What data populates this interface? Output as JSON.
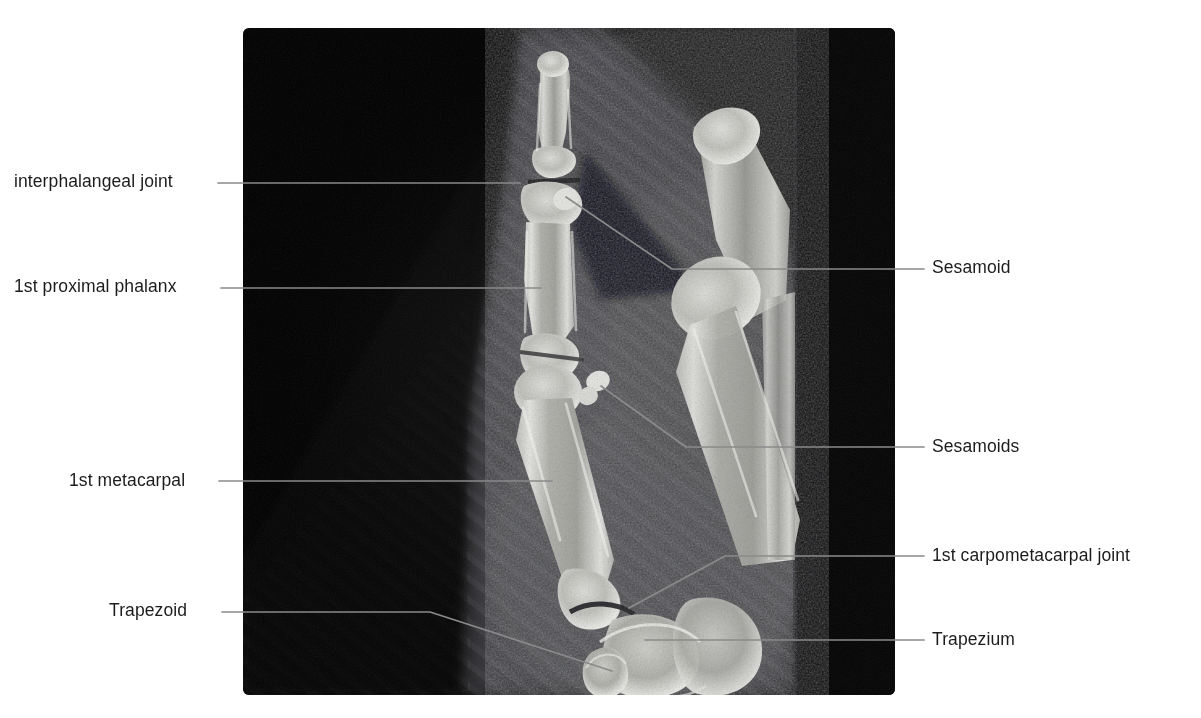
{
  "figure": {
    "type": "annotated-radiograph",
    "background_color": "#ffffff",
    "text_color": "#1c1c1c",
    "leader_color": "#8a8a8a",
    "panel": {
      "x": 243,
      "y": 28,
      "width": 652,
      "height": 667,
      "background_color": "#050505",
      "corner_radius": 6
    }
  },
  "labels": {
    "left": [
      {
        "id": "interphalangeal-joint",
        "text": "interphalangeal joint",
        "text_x": 14,
        "text_y": 172,
        "leader": "M218,183 L520,183"
      },
      {
        "id": "first-proximal-phalanx",
        "text": "1st proximal phalanx",
        "text_x": 14,
        "text_y": 277,
        "leader": "M221,288 L541,288"
      },
      {
        "id": "first-metacarpal",
        "text": "1st metacarpal",
        "text_x": 69,
        "text_y": 471,
        "leader": "M219,481 L552,481"
      },
      {
        "id": "trapezoid",
        "text": "Trapezoid",
        "text_x": 109,
        "text_y": 601,
        "leader": "M222,612 L430,612 L612,671"
      }
    ],
    "right": [
      {
        "id": "sesamoid",
        "text": "Sesamoid",
        "text_x": 932,
        "text_y": 258,
        "leader": "M924,269 L672,269 L566,197"
      },
      {
        "id": "sesamoids",
        "text": "Sesamoids",
        "text_x": 932,
        "text_y": 437,
        "leader": "M924,447 L686,447 L601,386"
      },
      {
        "id": "first-carpometacarpal-joint",
        "text": "1st carpometacarpal joint",
        "text_x": 932,
        "text_y": 546,
        "leader": "M924,556 L725,556 L629,608"
      },
      {
        "id": "trapezium",
        "text": "Trapezium",
        "text_x": 932,
        "text_y": 630,
        "leader": "M924,640 L645,640"
      }
    ]
  }
}
